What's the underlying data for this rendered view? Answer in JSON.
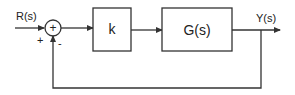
{
  "diagram": {
    "type": "control-block-diagram",
    "input_label": "R(s)",
    "output_label": "Y(s)",
    "summing_junction": {
      "symbol": "+",
      "input_sign": "+",
      "feedback_sign": "-"
    },
    "blocks": [
      {
        "id": "controller",
        "label": "k"
      },
      {
        "id": "plant",
        "label": "G(s)"
      }
    ],
    "feedback": "unity negative feedback",
    "colors": {
      "stroke": "#333333",
      "background": "#ffffff"
    }
  }
}
